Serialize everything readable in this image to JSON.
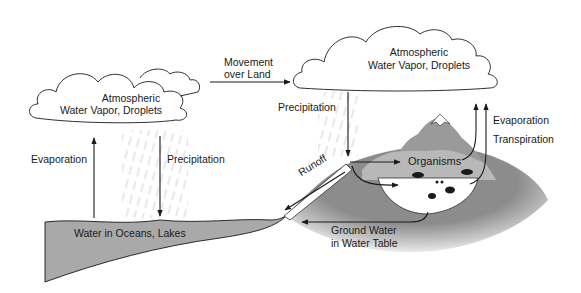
{
  "clouds": {
    "left": {
      "line1": "Atmospheric",
      "line2": "Water Vapor, Droplets"
    },
    "right": {
      "line1": "Atmospheric",
      "line2": "Water Vapor, Droplets"
    }
  },
  "labels": {
    "movement_line1": "Movement",
    "movement_line2": "over Land",
    "evaporation_left": "Evaporation",
    "precipitation_left": "Precipitation",
    "precipitation_right": "Precipitation",
    "evaporation_right": "Evaporation",
    "transpiration": "Transpiration",
    "runoff": "Runoff",
    "organisms": "Organisms",
    "ocean": "Water in Oceans, Lakes",
    "groundwater_line1": "Ground Water",
    "groundwater_line2": "in Water Table"
  },
  "colors": {
    "ocean": "#a9a9a9",
    "land_dark": "#8c8c8c",
    "land_light": "#d8d8d8",
    "mountain": "#9a9a9a",
    "forest": "#b8b8b8",
    "snow": "#ffffff",
    "lines": "#1a1a1a"
  }
}
